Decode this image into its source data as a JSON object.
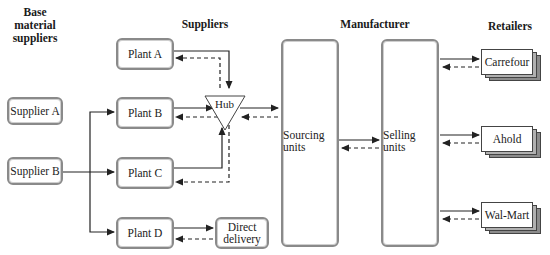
{
  "headers": {
    "base": "Base material suppliers",
    "base_line1": "Base material",
    "base_line2": "suppliers",
    "suppliers": "Suppliers",
    "manufacturer": "Manufacturer",
    "retailers": "Retailers"
  },
  "nodes": {
    "supplier_a": "Supplier A",
    "supplier_b": "Supplier B",
    "plant_a": "Plant A",
    "plant_b": "Plant B",
    "plant_c": "Plant C",
    "plant_d": "Plant D",
    "hub": "Hub",
    "direct_delivery_1": "Direct",
    "direct_delivery_2": "delivery",
    "sourcing_1": "Sourcing",
    "sourcing_2": "units",
    "selling_1": "Selling",
    "selling_2": "units",
    "carrefour": "Carrefour",
    "ahold": "Ahold",
    "walmart": "Wal-Mart"
  },
  "legend_semantics": {
    "solid_arrow": "material flow",
    "dashed_arrow": "return / information flow"
  }
}
